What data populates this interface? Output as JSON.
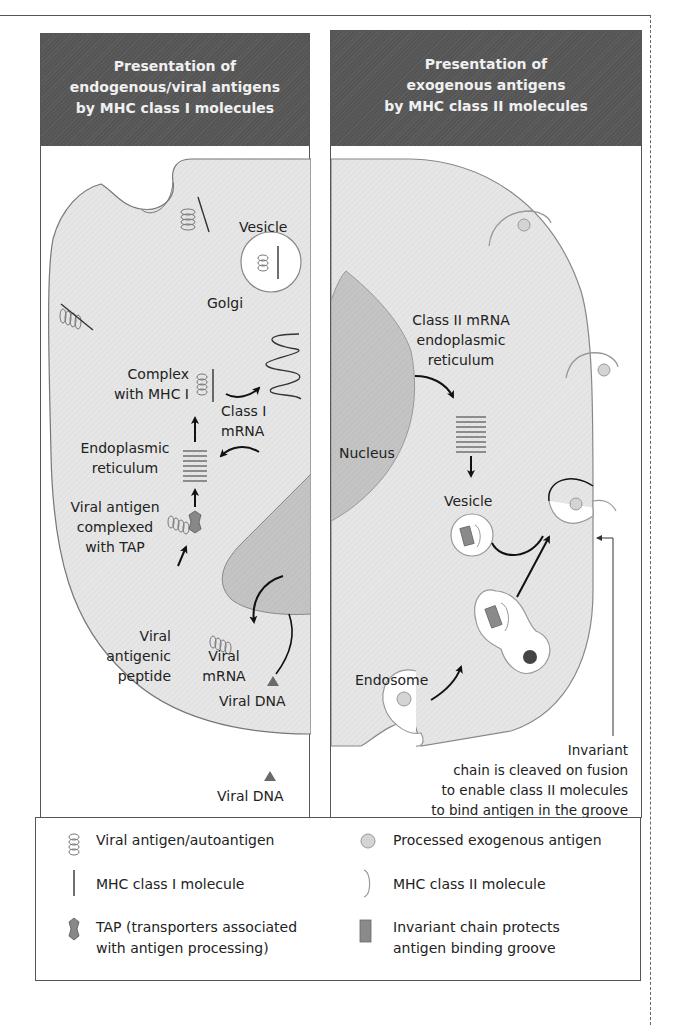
{
  "left_panel": {
    "header": [
      "Presentation of",
      "endogenous/viral antigens",
      "by MHC class I molecules"
    ],
    "labels": {
      "vesicle": "Vesicle",
      "golgi": "Golgi",
      "complex": [
        "Complex",
        "with MHC I"
      ],
      "class_i_mrna": [
        "Class I",
        "mRNA"
      ],
      "er": [
        "Endoplasmic",
        "reticulum"
      ],
      "viral_antigen_tap": [
        "Viral antigen",
        "complexed",
        "with TAP"
      ],
      "viral_peptide": [
        "Viral",
        "antigenic",
        "peptide"
      ],
      "viral_mrna": [
        "Viral",
        "mRNA"
      ],
      "viral_dna_inside": "Viral DNA",
      "viral_dna_outside": "Viral DNA"
    }
  },
  "right_panel": {
    "header": [
      "Presentation of",
      "exogenous antigens",
      "by MHC class II molecules"
    ],
    "labels": {
      "class_ii_er": [
        "Class II mRNA",
        "endoplasmic",
        "reticulum"
      ],
      "nucleus": "Nucleus",
      "vesicle": "Vesicle",
      "endosome": "Endosome",
      "invariant_note": [
        "Invariant",
        "chain is cleaved on fusion",
        "to enable class II molecules",
        "to bind antigen in the groove"
      ]
    }
  },
  "legend": {
    "items": [
      {
        "icon": "coil-icon",
        "label": [
          "Viral antigen/autoantigen"
        ]
      },
      {
        "icon": "bar-icon",
        "label": [
          "MHC class I molecule"
        ]
      },
      {
        "icon": "tap-icon",
        "label": [
          "TAP (transporters associated",
          "with antigen processing)"
        ]
      },
      {
        "icon": "circle-icon",
        "label": [
          "Processed exogenous antigen"
        ]
      },
      {
        "icon": "bracket-icon",
        "label": [
          "MHC class II molecule"
        ]
      },
      {
        "icon": "rect-icon",
        "label": [
          "Invariant chain protects",
          "antigen binding groove"
        ]
      }
    ]
  },
  "colors": {
    "header_bg": "#555555",
    "header_text": "#f0f0f0",
    "cell_fill": "#e6e6e6",
    "nucleus_fill": "#c4c4c4",
    "invariant_chain": "#8a8a8a",
    "antigen_circle": "#d4d4d4",
    "line": "#555555",
    "arrow": "#111111"
  }
}
